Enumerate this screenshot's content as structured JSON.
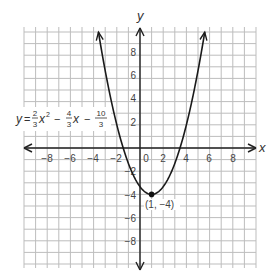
{
  "chart_data": {
    "type": "line",
    "title": "",
    "xlabel": "x",
    "ylabel": "y",
    "xlim": [
      -10,
      10
    ],
    "ylim": [
      -10,
      10
    ],
    "grid": true,
    "x_ticks": [
      -8,
      -6,
      -4,
      -2,
      0,
      2,
      4,
      6,
      8
    ],
    "y_ticks": [
      8,
      6,
      4,
      2,
      -2,
      -4,
      -6,
      -8
    ],
    "series": [
      {
        "name": "y = (2/3)x^2 - (4/3)x - 10/3",
        "function": "y = 2/3*x^2 - 4/3*x - 10/3",
        "coefficients": {
          "a": 0.6667,
          "b": -1.3333,
          "c": -3.3333
        },
        "x": [
          -3.58,
          -3,
          -2,
          -1,
          0,
          1,
          2,
          3,
          4,
          5,
          5.58
        ],
        "y": [
          10,
          6,
          2,
          -1.33,
          -3.33,
          -4,
          -3.33,
          -1.33,
          2,
          6,
          10
        ]
      }
    ],
    "annotations": [
      {
        "text": "(1, −4)",
        "x": 1,
        "y": -4,
        "type": "vertex-point"
      },
      {
        "text": "y = 2/3 x² − 4/3 x − 10/3",
        "type": "equation-label"
      }
    ]
  },
  "labels": {
    "x_axis": "x",
    "y_axis": "y",
    "vertex": "(1, −4)",
    "eq_y": "y",
    "eq_eq": "=",
    "eq_f1_num": "2",
    "eq_f1_den": "3",
    "eq_x2": "x",
    "eq_sup": "2",
    "eq_minus1": "−",
    "eq_f2_num": "4",
    "eq_f2_den": "3",
    "eq_x": "x",
    "eq_minus2": "−",
    "eq_f3_num": "10",
    "eq_f3_den": "3",
    "xt": [
      "−8",
      "−6",
      "−4",
      "−2",
      "0",
      "2",
      "4",
      "6",
      "8"
    ],
    "yt": [
      "8",
      "6",
      "4",
      "2",
      "−2",
      "−4",
      "−6",
      "−8"
    ]
  },
  "colors": {
    "grid": "#bdbdbd",
    "axis": "#222222",
    "curve": "#1a1a1a",
    "text": "#444444"
  }
}
